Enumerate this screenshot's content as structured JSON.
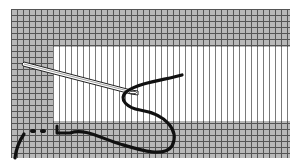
{
  "illustration": {
    "subject": "needle and thread weaving through mesh canvas",
    "icon": "needle-thread-icon",
    "colors": {
      "grid_fill": "#b8b8b8",
      "grid_lines": "#555555",
      "window_fill": "#ffffff",
      "window_lines": "#7a7a7a",
      "thread": "#111111",
      "needle": "#ffffff"
    }
  }
}
